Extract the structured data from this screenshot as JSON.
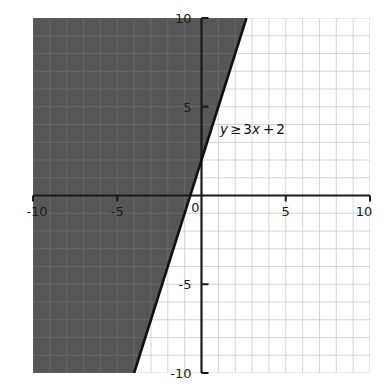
{
  "figure": {
    "background_color": "#ffffff",
    "plot_background_color": "#ffffff",
    "shade_color": "#565656",
    "grid_color": "#c9c9c9",
    "shade_grid_color": "#6d6d6d",
    "axis_color": "#1a1a1a",
    "line_color": "#111111"
  },
  "annotation": {
    "full_text": "y ≥ 3x + 2",
    "var_y": "y",
    "relation": "≥",
    "rhs_coeff_var": "3x",
    "plus": "+",
    "constant": "2"
  },
  "axes": {
    "x_ticks": [
      "-10",
      "-5",
      "0",
      "5",
      "10"
    ],
    "y_ticks": [
      "10",
      "5",
      "-5",
      "-10"
    ],
    "origin_label": "0"
  },
  "chart_data": {
    "type": "line",
    "title": "",
    "subtitle": "",
    "xlabel": "",
    "ylabel": "",
    "xlim": [
      -10,
      10
    ],
    "ylim": [
      -10,
      10
    ],
    "grid": true,
    "grid_step": 1,
    "legend": "none",
    "annotations": [
      {
        "text": "y ≥ 3x + 2",
        "x": 1.1,
        "y": 3.45
      }
    ],
    "xticks": [
      -10,
      -5,
      0,
      5,
      10
    ],
    "yticks": [
      -10,
      -5,
      5,
      10
    ],
    "xticklabels": [
      "-10",
      "-5",
      "0",
      "5",
      "10"
    ],
    "yticklabels": [
      "-10",
      "-5",
      "5",
      "10"
    ],
    "series": [
      {
        "name": "y = 3x + 2",
        "type": "line",
        "style": "solid",
        "color": "#111111",
        "slope": 3,
        "intercept": 2,
        "x": [
          -4,
          2.6667
        ],
        "y": [
          -10,
          10
        ],
        "endpoints": [
          {
            "x": -4,
            "y": -10
          },
          {
            "x": -2,
            "y": -4
          },
          {
            "x": 0,
            "y": 2
          },
          {
            "x": 2.6667,
            "y": 10
          }
        ]
      }
    ],
    "shaded_region": {
      "name": "y ≥ 3x + 2",
      "inequality": "y >= 3x + 2",
      "fill_color": "#565656",
      "boundary": "solid",
      "side": "above-left",
      "polygon": [
        {
          "x": -10,
          "y": -10
        },
        {
          "x": -4,
          "y": -10
        },
        {
          "x": 2.6667,
          "y": 10
        },
        {
          "x": -10,
          "y": 10
        }
      ]
    }
  }
}
